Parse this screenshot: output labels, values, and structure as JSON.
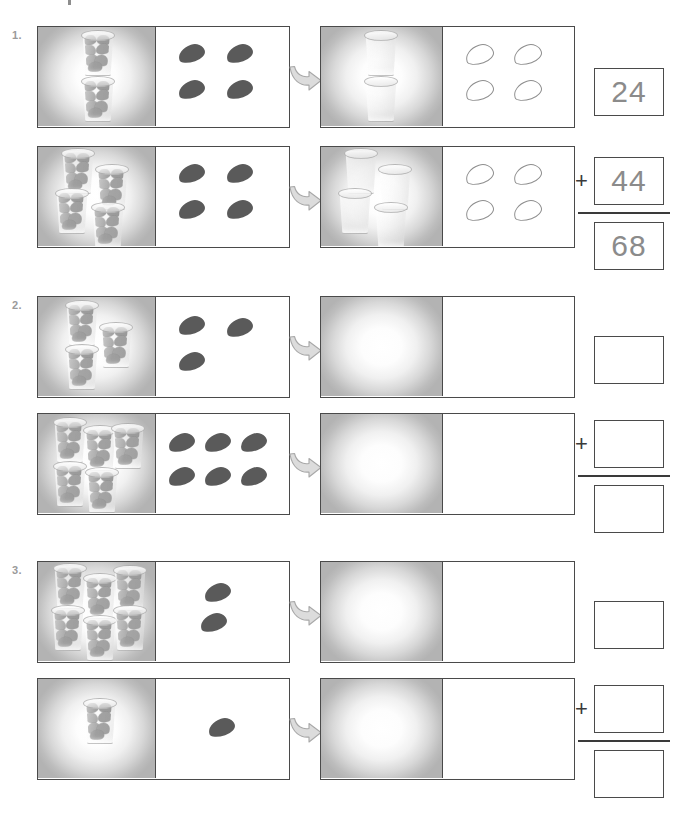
{
  "worksheet": {
    "title_fragment": "",
    "cup_label": "cup-of-beans",
    "bean_label": "bean",
    "arrow_label": "transfer-arrow"
  },
  "symbols": {
    "plus": "+"
  },
  "problems": [
    {
      "number": "1.",
      "rows": [
        {
          "source": {
            "cups_filled": 2,
            "beans_solid": 4
          },
          "result": {
            "cups_empty": 2,
            "beans_outline": 4
          },
          "answer": "24"
        },
        {
          "source": {
            "cups_filled": 4,
            "beans_solid": 4
          },
          "result": {
            "cups_empty": 4,
            "beans_outline": 4
          },
          "answer": "44"
        }
      ],
      "sum": "68"
    },
    {
      "number": "2.",
      "rows": [
        {
          "source": {
            "cups_filled": 3,
            "beans_solid": 3
          },
          "result": {
            "cups_empty": 0,
            "beans_outline": 0
          },
          "answer": ""
        },
        {
          "source": {
            "cups_filled": 5,
            "beans_solid": 6
          },
          "result": {
            "cups_empty": 0,
            "beans_outline": 0
          },
          "answer": ""
        }
      ],
      "sum": ""
    },
    {
      "number": "3.",
      "rows": [
        {
          "source": {
            "cups_filled": 6,
            "beans_solid": 2
          },
          "result": {
            "cups_empty": 0,
            "beans_outline": 0
          },
          "answer": ""
        },
        {
          "source": {
            "cups_filled": 1,
            "beans_solid": 1
          },
          "result": {
            "cups_empty": 0,
            "beans_outline": 0
          },
          "answer": ""
        }
      ],
      "sum": ""
    }
  ]
}
